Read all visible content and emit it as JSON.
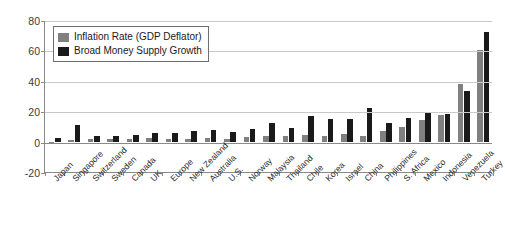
{
  "chart_data": {
    "type": "bar",
    "title": "",
    "xlabel": "",
    "ylabel": "",
    "ylim": [
      -20,
      80
    ],
    "yticks": [
      -20,
      0,
      20,
      40,
      60,
      80
    ],
    "ytick_labels": [
      "-20",
      "0",
      "20",
      "40",
      "60",
      "80"
    ],
    "grid": true,
    "legend_position": "upper-left-inside",
    "categories": [
      "Japan",
      "Singapore",
      "Switzerland",
      "Sweden",
      "Canada",
      "UK",
      "Europe",
      "New Zealand",
      "Australia",
      "U.S.",
      "Norway",
      "Malaysia",
      "Thailand",
      "Chile",
      "Korea",
      "Israel",
      "China",
      "Philippines",
      "S. Africa",
      "Mexico",
      "Indonesia",
      "Venezuela",
      "Turkey"
    ],
    "series": [
      {
        "name": "Inflation Rate (GDP Deflator)",
        "color": "#808080",
        "values": [
          -1,
          1,
          1.5,
          1.5,
          2,
          2.5,
          2,
          2,
          2.5,
          2,
          3,
          3.5,
          3.5,
          4.5,
          3.5,
          5,
          4,
          7,
          9.5,
          14.5,
          17.5,
          38,
          60
        ]
      },
      {
        "name": "Broad Money Supply Growth",
        "color": "#1a1a1a",
        "values": [
          2.5,
          11,
          4,
          4,
          4.5,
          5.5,
          6,
          7,
          7.5,
          6.5,
          8,
          12.5,
          9,
          17,
          15,
          15,
          22,
          12,
          15.5,
          19.5,
          18.5,
          33,
          72
        ]
      }
    ]
  },
  "legend": {
    "items": [
      {
        "label": "Inflation Rate (GDP Deflator)",
        "swatch": "gray"
      },
      {
        "label": "Broad Money Supply Growth",
        "swatch": "black"
      }
    ]
  }
}
